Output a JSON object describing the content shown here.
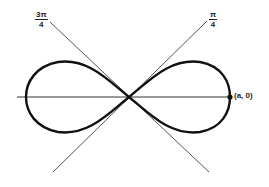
{
  "diagram": {
    "curve": "lemniscate",
    "lines": [
      {
        "name": "pi-over-4",
        "label_num": "π",
        "label_den": "4"
      },
      {
        "name": "three-pi-over-4",
        "label_num": "3π",
        "label_den": "4"
      }
    ],
    "point_label": "(a, 0)",
    "colors": {
      "curve": "#111111",
      "lines": "#555555",
      "axis": "#333333"
    }
  }
}
